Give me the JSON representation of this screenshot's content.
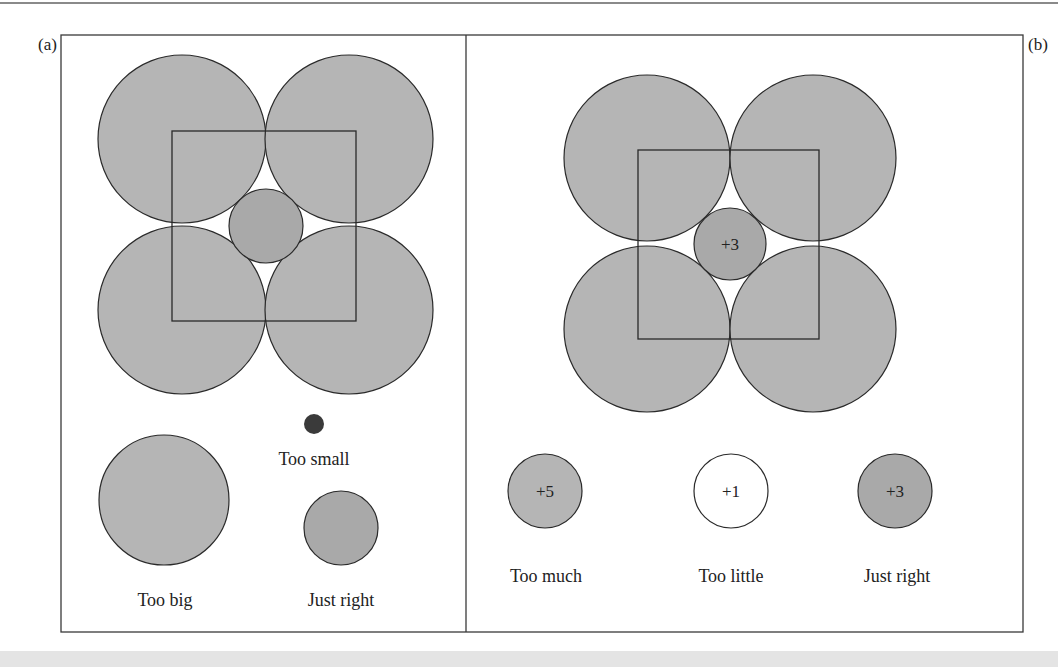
{
  "figure": {
    "colors": {
      "circle_fill": "#b5b5b5",
      "center_fill": "#a9a9a9",
      "small_dot": "#3a3a3a",
      "stroke": "#2a2a2a",
      "empty_fill": "#ffffff"
    },
    "panel_a": {
      "label": "(a)",
      "center_circle": "",
      "items": [
        {
          "label": "Too small",
          "size": "small"
        },
        {
          "label": "Too big",
          "size": "big"
        },
        {
          "label": "Just right",
          "size": "medium"
        }
      ]
    },
    "panel_b": {
      "label": "(b)",
      "center_circle": "+3",
      "items": [
        {
          "value": "+5",
          "label": "Too much"
        },
        {
          "value": "+1",
          "label": "Too little"
        },
        {
          "value": "+3",
          "label": "Just right"
        }
      ]
    }
  }
}
